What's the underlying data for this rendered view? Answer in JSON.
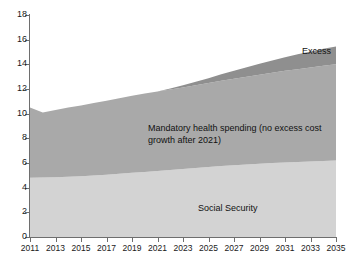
{
  "chart_data": {
    "type": "area",
    "stacked": true,
    "title": "",
    "subtitle": "",
    "xlabel": "",
    "ylabel": "",
    "xlim": [
      2011,
      2035
    ],
    "ylim": [
      0,
      18
    ],
    "ytick_step": 2,
    "xtick_step": 2,
    "grid": false,
    "legend": "in-plot annotations",
    "x": [
      2011,
      2012,
      2013,
      2014,
      2015,
      2016,
      2017,
      2018,
      2019,
      2020,
      2021,
      2022,
      2023,
      2024,
      2025,
      2026,
      2027,
      2028,
      2029,
      2030,
      2031,
      2032,
      2033,
      2034,
      2035
    ],
    "xtick_labels": [
      "2011",
      "2013",
      "2015",
      "2017",
      "2019",
      "2021",
      "2023",
      "2025",
      "2027",
      "2029",
      "2031",
      "2033",
      "2035"
    ],
    "ytick_labels": [
      "0",
      "2",
      "4",
      "6",
      "8",
      "10",
      "12",
      "14",
      "16",
      "18"
    ],
    "series": [
      {
        "name": "Social Security",
        "color": "#d3d3d3",
        "values": [
          4.8,
          4.82,
          4.85,
          4.88,
          4.92,
          4.98,
          5.05,
          5.12,
          5.2,
          5.28,
          5.36,
          5.44,
          5.52,
          5.6,
          5.68,
          5.75,
          5.82,
          5.88,
          5.94,
          6.0,
          6.05,
          6.09,
          6.13,
          6.17,
          6.2
        ]
      },
      {
        "name": "Mandatory health spending (no excess cost growth after 2021)",
        "color": "#a9a9a9",
        "values": [
          5.7,
          5.28,
          5.45,
          5.62,
          5.75,
          5.88,
          6.0,
          6.12,
          6.25,
          6.35,
          6.44,
          6.52,
          6.6,
          6.7,
          6.8,
          6.92,
          7.02,
          7.12,
          7.22,
          7.32,
          7.42,
          7.52,
          7.62,
          7.72,
          7.8
        ]
      },
      {
        "name": "Excess",
        "color": "#8f8f8f",
        "values": [
          0.0,
          0.0,
          0.0,
          0.0,
          0.0,
          0.0,
          0.0,
          0.0,
          0.0,
          0.0,
          0.0,
          0.08,
          0.18,
          0.28,
          0.4,
          0.52,
          0.64,
          0.76,
          0.88,
          1.0,
          1.1,
          1.2,
          1.3,
          1.38,
          1.45
        ]
      }
    ],
    "totals": [
      10.5,
      10.1,
      10.3,
      10.5,
      10.67,
      10.86,
      11.05,
      11.24,
      11.45,
      11.63,
      11.8,
      12.04,
      12.3,
      12.58,
      12.88,
      13.19,
      13.48,
      13.76,
      14.04,
      14.32,
      14.57,
      14.81,
      15.05,
      15.27,
      15.45
    ],
    "annotations": [
      {
        "name": "excess-label",
        "text": "Excess"
      },
      {
        "name": "health-label",
        "text": "Mandatory health spending (no excess cost\ngrowth after 2021)"
      },
      {
        "name": "social-security-label",
        "text": "Social Security"
      }
    ]
  },
  "annotations": {
    "excess": "Excess",
    "health": "Mandatory health spending (no excess cost\ngrowth after 2021)",
    "social": "Social Security"
  }
}
